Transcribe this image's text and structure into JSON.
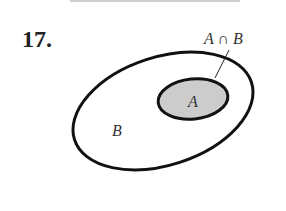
{
  "problem_number": "17.",
  "diagram": {
    "outer_set_label": "B",
    "inner_set_label": "A",
    "callout_label": "A ∩ B",
    "inner_fill": "#cccccc",
    "stroke": "#111111"
  }
}
